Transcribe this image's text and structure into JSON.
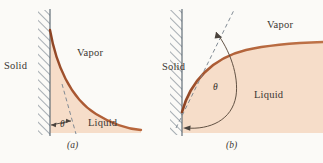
{
  "figure": {
    "background_color": "#fbfaf7",
    "liquid_fill_color": "#f6ddc9",
    "interface_curve_color": "#9d4f2c",
    "interface_curve_highlight": "#c97a52",
    "hatch_line_color": "#5c6a78",
    "dashed_line_color": "#6f7b86",
    "text_color": "#3b3632"
  },
  "panels": [
    {
      "id": "a",
      "caption": "(a)",
      "description": "Wetting liquid, contact angle less than 90 degrees",
      "labels": {
        "solid": "Solid",
        "vapor": "Vapor",
        "liquid": "Liquid",
        "angle_symbol": "θ"
      }
    },
    {
      "id": "b",
      "caption": "(b)",
      "description": "Nonwetting liquid, contact angle greater than 90 degrees",
      "labels": {
        "solid": "Solid",
        "vapor": "Vapor",
        "liquid": "Liquid",
        "angle_symbol": "θ"
      }
    }
  ]
}
